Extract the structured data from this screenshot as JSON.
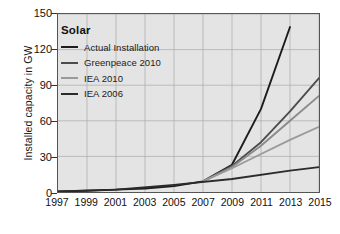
{
  "chart_data": {
    "type": "line",
    "title": "",
    "xlabel": "",
    "ylabel": "Installed capacity in GW",
    "xlim": [
      1997,
      2015
    ],
    "ylim": [
      0,
      150
    ],
    "grid": true,
    "legend_position": "top-left",
    "legend_title": "Solar",
    "xticks": [
      "1997",
      "1999",
      "2001",
      "2003",
      "2005",
      "2007",
      "2009",
      "2011",
      "2013",
      "2015"
    ],
    "yticks": [
      "0",
      "30",
      "60",
      "90",
      "120",
      "150"
    ],
    "series": [
      {
        "name": "Actual Installation",
        "color": "#1c1c1c",
        "x": [
          1997,
          1999,
          2001,
          2003,
          2005,
          2007,
          2009,
          2011,
          2013
        ],
        "values": [
          0.5,
          1,
          2,
          3,
          5,
          9,
          23,
          70,
          139
        ]
      },
      {
        "name": "Greenpeace 2010",
        "color": "#4c4c4c",
        "x": [
          2007,
          2009,
          2011,
          2013,
          2015
        ],
        "values": [
          9,
          22,
          42,
          68,
          96
        ]
      },
      {
        "name": "IEA 2010",
        "color": "#8a8a8a",
        "x": [
          2007,
          2009,
          2011,
          2013,
          2015
        ],
        "values": [
          9,
          21,
          39,
          60,
          81
        ]
      },
      {
        "name": "IEA 2010 low",
        "color": "#9a9a9a",
        "x": [
          2007,
          2009,
          2011,
          2013,
          2015
        ],
        "values": [
          9,
          20,
          32,
          44,
          55
        ]
      },
      {
        "name": "IEA 2006",
        "color": "#2b2b2b",
        "x": [
          1997,
          2001,
          2005,
          2009,
          2013,
          2015
        ],
        "values": [
          0.5,
          2,
          6,
          11,
          18,
          21
        ]
      }
    ]
  },
  "legend": {
    "title": "Solar",
    "items": [
      {
        "label": "Actual Installation",
        "color": "#1c1c1c"
      },
      {
        "label": "Greenpeace 2010",
        "color": "#4c4c4c"
      },
      {
        "label": "IEA 2010",
        "color": "#9a9a9a"
      },
      {
        "label": "IEA 2006",
        "color": "#2b2b2b"
      }
    ]
  },
  "axes": {
    "y_axis_label": "Installed capacity in GW"
  }
}
